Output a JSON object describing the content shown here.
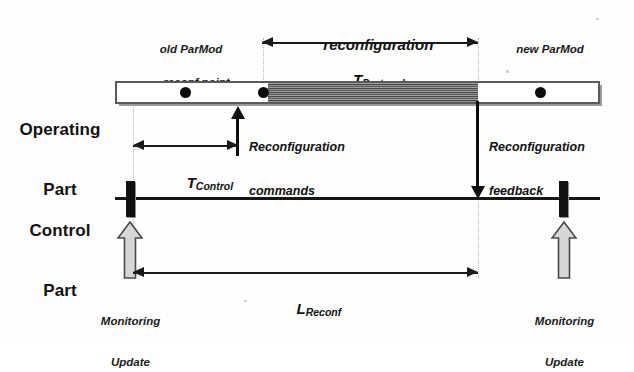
{
  "diagram": {
    "rows": {
      "operating": {
        "label_line1": "Operating",
        "label_line2": "Part"
      },
      "control": {
        "label_line1": "Control",
        "label_line2": "Part"
      }
    },
    "annotations": {
      "old_config_line1": "old ParMod",
      "old_config_line2": "Configuration",
      "new_config_line1": "new ParMod",
      "new_config_line2": "Configuration",
      "reconf_point": "reconf point",
      "reconfiguration": "reconfiguration",
      "t_protocol_base": "T",
      "t_protocol_sub": "Protocol",
      "t_control_base": "T",
      "t_control_sub": "Control",
      "l_reconf_base": "L",
      "l_reconf_sub": "Reconf",
      "reconf_commands_line1": "Reconfiguration",
      "reconf_commands_line2": "commands",
      "reconf_feedback_line1": "Reconfiguration",
      "reconf_feedback_line2": "feedback",
      "monitoring_update_left_line1": "Monitoring",
      "monitoring_update_left_line2": "Update",
      "monitoring_update_right_line1": "Monitoring",
      "monitoring_update_right_line2": "Update"
    },
    "colors": {
      "background": "#ffffff",
      "ink": "#111111",
      "bar_border": "#5a5a5a",
      "bar_fill": "#ffffff",
      "bar_shadow": "#9a9a9a",
      "hatch_fill": "#7d7d7d",
      "hatch_stripe": "#4a4a4a",
      "guide_line": "#b4b4b4",
      "hollow_arrow_fill": "#d6d6d6",
      "hollow_arrow_stroke": "#4a4a4a"
    },
    "geometry": {
      "width": 634,
      "height": 342,
      "operating_bar": {
        "x": 115,
        "y": 81,
        "w": 485,
        "h": 23
      },
      "control_line": {
        "x": 115,
        "y": 197,
        "w": 485,
        "h": 3
      },
      "hatched_region": {
        "x": 268,
        "y": 83,
        "w": 210,
        "h": 19,
        "segments": 5
      },
      "event_dots_x": [
        185,
        263,
        540
      ],
      "control_ticks_x": [
        130,
        563
      ],
      "reconfiguration_span_x": [
        262,
        478
      ],
      "t_control_span_x": [
        133,
        238
      ],
      "l_reconf_span_x": [
        133,
        478
      ]
    }
  }
}
